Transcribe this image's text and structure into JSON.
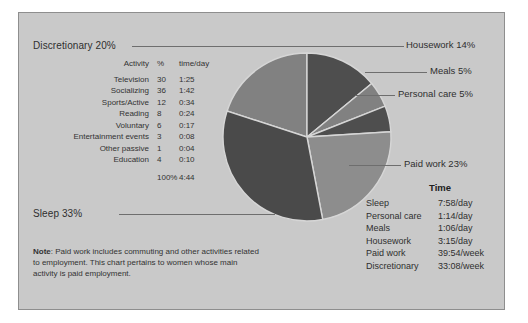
{
  "chart_data": {
    "type": "pie",
    "title": "",
    "categories": [
      "Discretionary",
      "Housework",
      "Meals",
      "Personal care",
      "Paid work",
      "Sleep"
    ],
    "values": [
      20,
      14,
      5,
      5,
      23,
      33
    ],
    "unit": "%",
    "legend": "callout-labels",
    "grid": false,
    "slice_colors": [
      "#818181",
      "#4e4e4e",
      "#818181",
      "#4e4e4e",
      "#8d8d8d",
      "#4a4a4a"
    ],
    "annotations": [
      "Discretionary 20%",
      "Housework 14%",
      "Meals 5%",
      "Personal care 5%",
      "Paid work 23%",
      "Sleep 33%"
    ]
  },
  "labels": {
    "discretionary": "Discretionary 20%",
    "housework": "Housework 14%",
    "meals": "Meals 5%",
    "personal_care": "Personal care 5%",
    "paid_work": "Paid work 23%",
    "sleep": "Sleep 33%"
  },
  "activity_table": {
    "headers": [
      "Activity",
      "%",
      "time/day"
    ],
    "rows": [
      [
        "Television",
        "30",
        "1:25"
      ],
      [
        "Socializing",
        "36",
        "1:42"
      ],
      [
        "Sports/Active",
        "12",
        "0:34"
      ],
      [
        "Reading",
        "8",
        "0:24"
      ],
      [
        "Voluntary",
        "6",
        "0:17"
      ],
      [
        "Entertainment events",
        "3",
        "0:08"
      ],
      [
        "Other passive",
        "1",
        "0:04"
      ],
      [
        "Education",
        "4",
        "0:10"
      ]
    ],
    "total": [
      "",
      "100%",
      "4:44"
    ]
  },
  "time_table": {
    "header": "Time",
    "rows": [
      [
        "Sleep",
        "7:58/day"
      ],
      [
        "Personal care",
        "1:14/day"
      ],
      [
        "Meals",
        "1:06/day"
      ],
      [
        "Housework",
        "3:15/day"
      ],
      [
        "Paid work",
        "39:54/week"
      ],
      [
        "Discretionary",
        "33:08/week"
      ]
    ]
  },
  "note": {
    "label": "Note",
    "text": ": Paid work includes commuting and other activities related to employment. This chart pertains to women whose main activity is paid employment."
  },
  "colors": {
    "panel_bg": "#c9c9c9",
    "panel_border": "#8e8e8e",
    "text": "#2f2f2f",
    "leader_line": "#6e6e6e"
  }
}
